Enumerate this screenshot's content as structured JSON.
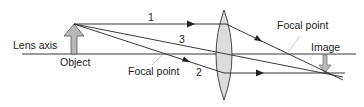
{
  "labels": {
    "lens_axis": "Lens axis",
    "object": "Object",
    "image": "Image",
    "focal_point_left": "Focal point",
    "focal_point_right": "Focal point"
  },
  "rays": [
    {
      "id": "1",
      "label": "1",
      "description": "parallel to axis, refracts through right focal point"
    },
    {
      "id": "2",
      "label": "2",
      "description": "through left focal point, exits parallel to axis"
    },
    {
      "id": "3",
      "label": "3",
      "description": "through lens center, undeviated"
    }
  ],
  "colors": {
    "line": "#222222",
    "lens_fill": "#dcdcdc",
    "arrow_fill": "#b8b8b8",
    "leader": "#aaaaaa"
  }
}
